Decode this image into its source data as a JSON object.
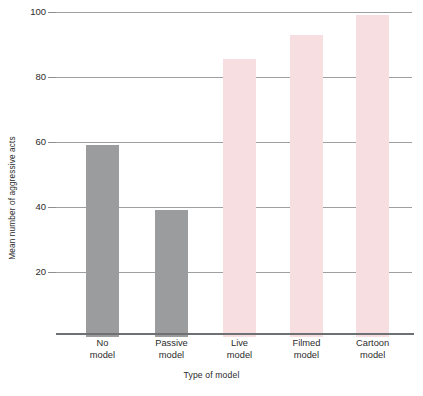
{
  "chart_data": {
    "type": "bar",
    "title": "",
    "subtitle": "",
    "xlabel": "Type of model",
    "ylabel": "Mean number of aggressive acts",
    "categories": [
      "No model",
      "Passive model",
      "Live model",
      "Filmed model",
      "Cartoon model"
    ],
    "category_lines": [
      [
        "No",
        "model"
      ],
      [
        "Passive",
        "model"
      ],
      [
        "Live",
        "model"
      ],
      [
        "Filmed",
        "model"
      ],
      [
        "Cartoon",
        "model"
      ]
    ],
    "values": [
      59,
      39,
      85.5,
      93,
      99
    ],
    "bar_colors": [
      "#9a9c9e",
      "#9a9c9e",
      "#f6dee1",
      "#f6dee1",
      "#f6dee1"
    ],
    "ylim": [
      0,
      100
    ],
    "yticks": [
      20,
      40,
      60,
      80,
      100
    ],
    "ytick_labels": [
      "20",
      "40",
      "60",
      "80",
      "100"
    ],
    "grid": true,
    "grid_axis": "y",
    "legend": "none",
    "bar_geometry": [
      {
        "left_pct": 8.4,
        "width_pct": 9.3
      },
      {
        "left_pct": 27.8,
        "width_pct": 9.3
      },
      {
        "left_pct": 46.9,
        "width_pct": 9.3
      },
      {
        "left_pct": 65.7,
        "width_pct": 9.3
      },
      {
        "left_pct": 84.3,
        "width_pct": 9.3
      }
    ]
  },
  "style": {
    "background": "#ffffff",
    "gridline_color": "#8c8f91",
    "axis_color": "#6e7173",
    "text_color": "#2b2b2b",
    "gray_bar": "#9a9c9e",
    "pink_bar": "#f6dee1"
  }
}
